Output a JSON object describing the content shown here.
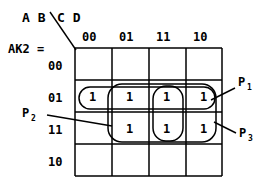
{
  "diagram": {
    "type": "karnaugh-map",
    "function_label": "AK2  =",
    "top_vars": "C D",
    "side_vars": "A B",
    "column_headers": [
      "00",
      "01",
      "11",
      "10"
    ],
    "row_headers": [
      "00",
      "01",
      "11",
      "10"
    ],
    "cells": [
      {
        "row": "00",
        "col": "00",
        "value": ""
      },
      {
        "row": "00",
        "col": "01",
        "value": ""
      },
      {
        "row": "00",
        "col": "11",
        "value": ""
      },
      {
        "row": "00",
        "col": "10",
        "value": ""
      },
      {
        "row": "01",
        "col": "00",
        "value": "1"
      },
      {
        "row": "01",
        "col": "01",
        "value": "1"
      },
      {
        "row": "01",
        "col": "11",
        "value": "1"
      },
      {
        "row": "01",
        "col": "10",
        "value": "1"
      },
      {
        "row": "11",
        "col": "00",
        "value": ""
      },
      {
        "row": "11",
        "col": "01",
        "value": "1"
      },
      {
        "row": "11",
        "col": "11",
        "value": "1"
      },
      {
        "row": "11",
        "col": "10",
        "value": "1"
      },
      {
        "row": "10",
        "col": "00",
        "value": ""
      },
      {
        "row": "10",
        "col": "01",
        "value": ""
      },
      {
        "row": "10",
        "col": "11",
        "value": ""
      },
      {
        "row": "10",
        "col": "10",
        "value": ""
      }
    ],
    "groups": [
      {
        "id": "p1",
        "label": "P",
        "subscript": "1"
      },
      {
        "id": "p2",
        "label": "P",
        "subscript": "2"
      },
      {
        "id": "p3",
        "label": "P",
        "subscript": "3"
      }
    ]
  }
}
